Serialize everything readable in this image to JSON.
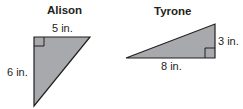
{
  "figures": [
    {
      "name": "Alison",
      "shape": "right-triangle",
      "top_leg": "5 in.",
      "side_leg": "6 in."
    },
    {
      "name": "Tyrone",
      "shape": "right-triangle",
      "bottom_leg": "8 in.",
      "side_leg": "3 in."
    }
  ],
  "colors": {
    "fill": "#a7a9ac",
    "stroke": "#231f20"
  }
}
